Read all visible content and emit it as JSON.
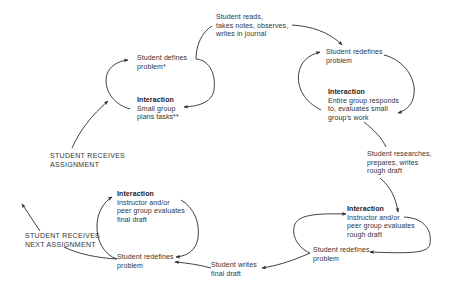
{
  "diagram": {
    "nodes": [
      {
        "id": "receives_assignment",
        "lines": [
          "STUDENT RECEIVES",
          "ASSIGNMENT"
        ]
      },
      {
        "id": "defines_problem",
        "lines": [
          "Student defines",
          "problem*"
        ]
      },
      {
        "id": "small_group",
        "heading": "Interaction",
        "lines": [
          "Small group",
          "plans tasks**"
        ]
      },
      {
        "id": "reads_notes",
        "lines": [
          "Student reads,",
          "takes notes, observes,",
          "writes in journal"
        ]
      },
      {
        "id": "redefines_1",
        "lines": [
          "Student redefines",
          "problem"
        ]
      },
      {
        "id": "entire_group",
        "heading": "Interaction",
        "lines": [
          "Entire group responds",
          "to, evaluates small",
          "group's work"
        ]
      },
      {
        "id": "researches",
        "lines": [
          "Student researches,",
          "prepares, writes",
          "rough draft"
        ]
      },
      {
        "id": "eval_rough",
        "heading": "Interaction",
        "lines": [
          "Instructor and/or",
          "peer group evaluates",
          "rough draft"
        ]
      },
      {
        "id": "redefines_2",
        "lines": [
          "Student redefines",
          "problem"
        ]
      },
      {
        "id": "writes_final",
        "lines": [
          "Student writes",
          "final draft"
        ]
      },
      {
        "id": "redefines_3",
        "lines": [
          "Student redefines",
          "problem"
        ]
      },
      {
        "id": "eval_final",
        "heading": "Interaction",
        "lines": [
          "Instructor and/or",
          "peer group evaluates",
          "final draft"
        ]
      },
      {
        "id": "next_assignment",
        "lines": [
          "STUDENT RECEIVES",
          "NEXT ASSIGNMENT"
        ]
      }
    ],
    "edges": [
      {
        "from": "receives_assignment",
        "to": "defines_problem"
      },
      {
        "from": "defines_problem",
        "to": "small_group"
      },
      {
        "from": "small_group",
        "to": "defines_problem"
      },
      {
        "from": "defines_problem",
        "to": "reads_notes"
      },
      {
        "from": "reads_notes",
        "to": "redefines_1"
      },
      {
        "from": "redefines_1",
        "to": "entire_group"
      },
      {
        "from": "entire_group",
        "to": "redefines_1"
      },
      {
        "from": "entire_group",
        "to": "researches"
      },
      {
        "from": "researches",
        "to": "eval_rough"
      },
      {
        "from": "eval_rough",
        "to": "redefines_2"
      },
      {
        "from": "redefines_2",
        "to": "eval_rough"
      },
      {
        "from": "redefines_2",
        "to": "writes_final"
      },
      {
        "from": "writes_final",
        "to": "redefines_3"
      },
      {
        "from": "redefines_3",
        "to": "eval_final"
      },
      {
        "from": "eval_final",
        "to": "redefines_3"
      },
      {
        "from": "redefines_3",
        "to": "next_assignment"
      }
    ],
    "colors": {
      "line": "#2b2b2b",
      "text": "#333333",
      "background": "#ffffff"
    }
  }
}
